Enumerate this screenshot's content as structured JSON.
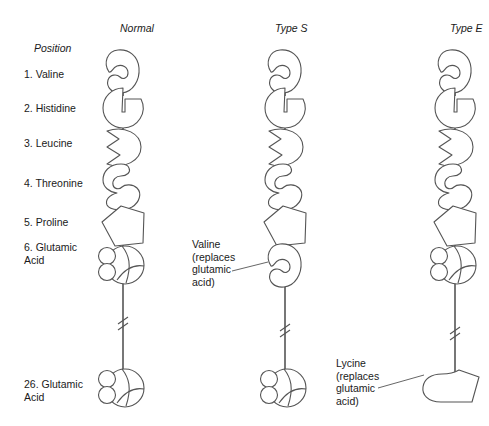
{
  "figure": {
    "background": "#ffffff",
    "stroke": "#555555",
    "text_color": "#1a1a1a"
  },
  "columns": [
    {
      "label": "Normal",
      "x": 120,
      "chain_x": 123
    },
    {
      "label": "Type S",
      "x": 275,
      "chain_x": 285
    },
    {
      "label": "Type E",
      "x": 450,
      "chain_x": 455
    }
  ],
  "position_header": "Position",
  "positions": [
    {
      "index": "1.",
      "name": "Valine",
      "label": "1. Valine",
      "y": 68,
      "shape": "kidney"
    },
    {
      "index": "2.",
      "name": "Histidine",
      "label": "2. Histidine",
      "y": 102,
      "shape": "notched-circle"
    },
    {
      "index": "3.",
      "name": "Leucine",
      "label": "3. Leucine",
      "y": 137,
      "shape": "zigzag-halfdisc"
    },
    {
      "index": "4.",
      "name": "Threonine",
      "label": "4. Threonine",
      "y": 177,
      "shape": "figure-eight"
    },
    {
      "index": "5.",
      "name": "Proline",
      "label": "5. Proline",
      "y": 216,
      "shape": "pentagon"
    },
    {
      "index": "6.",
      "name": "Glutamic Acid",
      "label": "6. Glutamic\n     Acid",
      "y": 247,
      "shape": "glutamic"
    },
    {
      "index": "26.",
      "name": "Glutamic Acid",
      "label": "26. Glutamic\n       Acid",
      "y": 378,
      "shape": "glutamic"
    }
  ],
  "annotations": [
    {
      "id": "type-s-valine",
      "text": "Valine\n(replaces\nglutamic\nacid)",
      "x": 192,
      "y": 238,
      "column": "Type S",
      "replaces": "glutamic acid",
      "at_position": "6"
    },
    {
      "id": "type-e-lycine",
      "text": "Lycine\n(replaces\nglutamic\nacid)",
      "x": 336,
      "y": 357,
      "column": "Type E",
      "replaces": "glutamic acid",
      "at_position": "26"
    }
  ],
  "chain_variants": {
    "Normal": {
      "pos6": "glutamic",
      "pos26": "glutamic"
    },
    "Type S": {
      "pos6": "kidney",
      "pos26": "glutamic"
    },
    "Type E": {
      "pos6": "glutamic",
      "pos26": "boot"
    }
  }
}
